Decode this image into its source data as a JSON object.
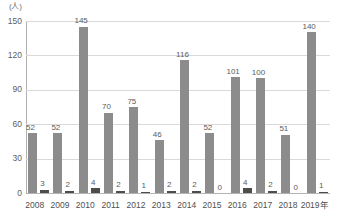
{
  "chart_data": {
    "type": "bar",
    "title": "",
    "subtitle": "",
    "xlabel": "",
    "ylabel": "(人)",
    "ylim": [
      0,
      150
    ],
    "yticks": [
      0,
      30,
      60,
      90,
      120,
      150
    ],
    "grid": true,
    "legend": "none",
    "categories": [
      "2008",
      "2009",
      "2010",
      "2011",
      "2012",
      "2013",
      "2014",
      "2015",
      "2016",
      "2017",
      "2018",
      "2019年"
    ],
    "series": [
      {
        "name": "series-1",
        "color": "#8c8c8c",
        "values": [
          52,
          52,
          145,
          70,
          75,
          46,
          116,
          52,
          101,
          100,
          51,
          140
        ]
      },
      {
        "name": "series-2",
        "color": "#4d4d4d",
        "values": [
          3,
          2,
          4,
          2,
          1,
          2,
          2,
          0,
          4,
          2,
          0,
          1
        ]
      }
    ]
  },
  "colors": {
    "primary_bar": "#8c8c8c",
    "secondary_bar": "#4d4d4d",
    "gridline": "#d9d9d9",
    "axis": "#b0b0b0",
    "text": "#5a5a5a",
    "background": "#ffffff"
  }
}
